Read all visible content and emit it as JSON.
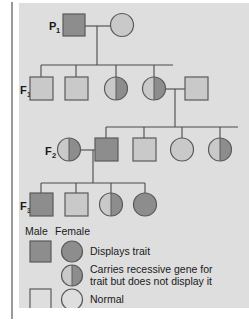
{
  "figure": {
    "type": "pedigree-chart",
    "background_color": "#dedede",
    "page_background": "#ffffff"
  },
  "colors": {
    "affected_fill": "#8d8d8d",
    "normal_fill": "#c9c9c9",
    "carrier_fill_left": "#c9c9c9",
    "carrier_fill_right": "#8d8d8d",
    "outline": "#5a5a5a",
    "line": "#4a4a4a",
    "text": "#1a1a1a"
  },
  "generations": [
    {
      "id": "P1",
      "label": "P",
      "subscript": "1"
    },
    {
      "id": "F1",
      "label": "F",
      "subscript": "1"
    },
    {
      "id": "F2",
      "label": "F",
      "subscript": "2"
    },
    {
      "id": "F3",
      "label": "F",
      "subscript": "3"
    }
  ],
  "individuals": {
    "p1": [
      {
        "id": "p1-male",
        "sex": "male",
        "status": "affected"
      },
      {
        "id": "p1-female",
        "sex": "female",
        "status": "normal"
      }
    ],
    "f1": [
      {
        "id": "f1-male-1",
        "sex": "male",
        "status": "normal"
      },
      {
        "id": "f1-male-2",
        "sex": "male",
        "status": "normal"
      },
      {
        "id": "f1-female-3",
        "sex": "female",
        "status": "carrier"
      },
      {
        "id": "f1-female-4",
        "sex": "female",
        "status": "carrier"
      },
      {
        "id": "f1-male-spouse",
        "sex": "male",
        "status": "normal"
      }
    ],
    "f2": [
      {
        "id": "f2-female-spouse",
        "sex": "female",
        "status": "carrier"
      },
      {
        "id": "f2-male-1",
        "sex": "male",
        "status": "affected"
      },
      {
        "id": "f2-male-2",
        "sex": "male",
        "status": "normal"
      },
      {
        "id": "f2-female-3",
        "sex": "female",
        "status": "normal"
      },
      {
        "id": "f2-female-4",
        "sex": "female",
        "status": "carrier"
      }
    ],
    "f3": [
      {
        "id": "f3-male-1",
        "sex": "male",
        "status": "affected"
      },
      {
        "id": "f3-male-2",
        "sex": "male",
        "status": "normal"
      },
      {
        "id": "f3-female-3",
        "sex": "female",
        "status": "carrier"
      },
      {
        "id": "f3-female-4",
        "sex": "female",
        "status": "affected"
      }
    ]
  },
  "legend": {
    "header_male": "Male",
    "header_female": "Female",
    "rows": [
      {
        "key": "affected",
        "label": "Displays trait"
      },
      {
        "key": "carrier",
        "label_line1": "Carries recessive gene for",
        "label_line2": "trait but does not display it"
      },
      {
        "key": "normal",
        "label": "Normal"
      }
    ]
  }
}
